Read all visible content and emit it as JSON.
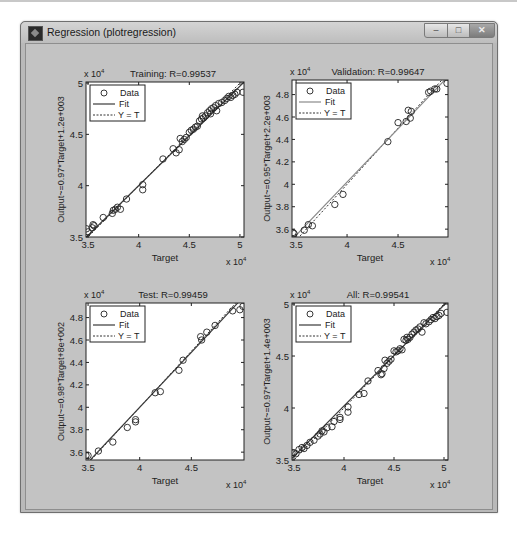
{
  "window": {
    "title": "Regression (plotregression)",
    "controls": {
      "minimize": "–",
      "maximize": "□",
      "close": "✕"
    }
  },
  "legend": {
    "data": "Data",
    "fit": "Fit",
    "yt": "Y = T"
  },
  "exponent_label": "x 10",
  "exponent_power": "4",
  "chart_data": [
    {
      "type": "scatter",
      "title": "Training: R=0.99537",
      "xlabel": "Target",
      "ylabel": "Output~=0.97*Target+1.2e+003",
      "xlim": [
        34800,
        50400
      ],
      "ylim": [
        35000,
        50100
      ],
      "xticks": [
        35000,
        40000,
        45000,
        50000
      ],
      "xtick_labels": [
        "3.5",
        "4",
        "4.5",
        "5"
      ],
      "yticks": [
        35000,
        40000,
        45000,
        50000
      ],
      "ytick_labels": [
        "3.5",
        "4",
        "4.5",
        "5"
      ],
      "fit": {
        "slope": 0.97,
        "intercept": 1200
      },
      "legend_position": "upper-left",
      "grid": false,
      "points": [
        [
          34850,
          35800
        ],
        [
          35000,
          35500
        ],
        [
          35400,
          35900
        ],
        [
          35500,
          36200
        ],
        [
          35600,
          36100
        ],
        [
          36500,
          36900
        ],
        [
          37400,
          37300
        ],
        [
          37500,
          37600
        ],
        [
          37700,
          37700
        ],
        [
          37900,
          37900
        ],
        [
          38200,
          37700
        ],
        [
          38800,
          38700
        ],
        [
          40400,
          40100
        ],
        [
          40400,
          39600
        ],
        [
          42400,
          42600
        ],
        [
          43400,
          43600
        ],
        [
          43700,
          43200
        ],
        [
          44000,
          43500
        ],
        [
          44100,
          44600
        ],
        [
          44300,
          44300
        ],
        [
          44500,
          44500
        ],
        [
          44700,
          44700
        ],
        [
          45000,
          45200
        ],
        [
          45200,
          45400
        ],
        [
          45400,
          45500
        ],
        [
          45600,
          45700
        ],
        [
          45800,
          45800
        ],
        [
          46000,
          46300
        ],
        [
          46200,
          46500
        ],
        [
          46300,
          46800
        ],
        [
          46400,
          46600
        ],
        [
          46600,
          46800
        ],
        [
          46800,
          47100
        ],
        [
          47000,
          47300
        ],
        [
          47100,
          47000
        ],
        [
          47200,
          47500
        ],
        [
          47400,
          47600
        ],
        [
          47600,
          47800
        ],
        [
          47700,
          47300
        ],
        [
          47900,
          48000
        ],
        [
          48200,
          48100
        ],
        [
          48500,
          48300
        ],
        [
          48700,
          48500
        ],
        [
          48900,
          48700
        ],
        [
          49100,
          48600
        ],
        [
          49300,
          48800
        ],
        [
          49500,
          48900
        ],
        [
          49700,
          49100
        ],
        [
          50300,
          49100
        ]
      ]
    },
    {
      "type": "scatter",
      "title": "Validation: R=0.99647",
      "xlabel": "Target",
      "ylabel": "Output~=0.95*Target+2.2e+003",
      "xlim": [
        34600,
        49900
      ],
      "ylim": [
        35300,
        49300
      ],
      "xticks": [
        35000,
        40000,
        45000
      ],
      "xtick_labels": [
        "3.5",
        "4",
        "4.5"
      ],
      "yticks": [
        36000,
        38000,
        40000,
        42000,
        44000,
        46000,
        48000
      ],
      "ytick_labels": [
        "3.6",
        "3.8",
        "4",
        "4.2",
        "4.4",
        "4.6",
        "4.8"
      ],
      "fit": {
        "slope": 0.95,
        "intercept": 2200
      },
      "legend_position": "upper-left",
      "grid": false,
      "points": [
        [
          34700,
          35700
        ],
        [
          34800,
          35600
        ],
        [
          35800,
          35900
        ],
        [
          36200,
          36400
        ],
        [
          36600,
          36300
        ],
        [
          38800,
          38200
        ],
        [
          39600,
          39100
        ],
        [
          44000,
          43800
        ],
        [
          45000,
          45500
        ],
        [
          45800,
          45600
        ],
        [
          46000,
          46600
        ],
        [
          46200,
          45900
        ],
        [
          46300,
          46500
        ],
        [
          48000,
          48200
        ],
        [
          48200,
          48300
        ],
        [
          48600,
          48500
        ],
        [
          48800,
          48500
        ],
        [
          49800,
          49000
        ]
      ]
    },
    {
      "type": "scatter",
      "title": "Test: R=0.99459",
      "xlabel": "Target",
      "ylabel": "Output~=0.98*Target+8e+002",
      "xlim": [
        34800,
        50100
      ],
      "ylim": [
        35300,
        49300
      ],
      "xticks": [
        35000,
        40000,
        45000
      ],
      "xtick_labels": [
        "3.5",
        "4",
        "4.5"
      ],
      "yticks": [
        36000,
        38000,
        40000,
        42000,
        44000,
        46000,
        48000
      ],
      "ytick_labels": [
        "3.6",
        "3.8",
        "4",
        "4.2",
        "4.4",
        "4.6",
        "4.8"
      ],
      "fit": {
        "slope": 0.98,
        "intercept": 800
      },
      "legend_position": "upper-left",
      "grid": false,
      "points": [
        [
          34800,
          35700
        ],
        [
          35000,
          35700
        ],
        [
          36000,
          36100
        ],
        [
          37400,
          36900
        ],
        [
          38800,
          38200
        ],
        [
          39600,
          38700
        ],
        [
          39600,
          38900
        ],
        [
          41500,
          41300
        ],
        [
          42000,
          41400
        ],
        [
          43800,
          43300
        ],
        [
          44200,
          44200
        ],
        [
          45900,
          46300
        ],
        [
          46000,
          46000
        ],
        [
          46500,
          46700
        ],
        [
          47300,
          47300
        ],
        [
          49000,
          48600
        ],
        [
          49700,
          48700
        ],
        [
          50000,
          49000
        ]
      ]
    },
    {
      "type": "scatter",
      "title": "All: R=0.99541",
      "xlabel": "Target",
      "ylabel": "Output~=0.97*Target+1.4e+003",
      "xlim": [
        34800,
        50400
      ],
      "ylim": [
        35000,
        50100
      ],
      "xticks": [
        35000,
        40000,
        45000,
        50000
      ],
      "xtick_labels": [
        "3.5",
        "4",
        "4.5",
        "5"
      ],
      "yticks": [
        35000,
        40000,
        45000,
        50000
      ],
      "ytick_labels": [
        "3.5",
        "4",
        "4.5",
        "5"
      ],
      "fit": {
        "slope": 0.97,
        "intercept": 1400
      },
      "legend_position": "upper-left",
      "grid": false,
      "points": [
        [
          34800,
          35700
        ],
        [
          35000,
          35700
        ],
        [
          35200,
          35600
        ],
        [
          35500,
          36000
        ],
        [
          35800,
          36200
        ],
        [
          36000,
          36100
        ],
        [
          36300,
          36400
        ],
        [
          36600,
          36700
        ],
        [
          37000,
          36900
        ],
        [
          37400,
          37300
        ],
        [
          37600,
          37500
        ],
        [
          37800,
          37800
        ],
        [
          38000,
          37700
        ],
        [
          38300,
          38100
        ],
        [
          38800,
          38200
        ],
        [
          39000,
          38700
        ],
        [
          39600,
          38900
        ],
        [
          39600,
          39100
        ],
        [
          40400,
          40100
        ],
        [
          40400,
          39600
        ],
        [
          41500,
          41300
        ],
        [
          42000,
          41400
        ],
        [
          42400,
          42600
        ],
        [
          43400,
          43600
        ],
        [
          43700,
          43200
        ],
        [
          43800,
          43300
        ],
        [
          44000,
          43800
        ],
        [
          44100,
          44600
        ],
        [
          44300,
          44300
        ],
        [
          44500,
          44500
        ],
        [
          44700,
          44700
        ],
        [
          45000,
          45500
        ],
        [
          45200,
          45400
        ],
        [
          45400,
          45500
        ],
        [
          45600,
          45700
        ],
        [
          45800,
          45600
        ],
        [
          46000,
          46600
        ],
        [
          46200,
          46500
        ],
        [
          46300,
          46800
        ],
        [
          46400,
          46600
        ],
        [
          46600,
          46800
        ],
        [
          46800,
          47100
        ],
        [
          47000,
          47300
        ],
        [
          47200,
          47500
        ],
        [
          47400,
          47600
        ],
        [
          47600,
          47800
        ],
        [
          47800,
          47300
        ],
        [
          48000,
          48200
        ],
        [
          48200,
          48100
        ],
        [
          48500,
          48300
        ],
        [
          48700,
          48500
        ],
        [
          48900,
          48700
        ],
        [
          49100,
          48600
        ],
        [
          49300,
          48800
        ],
        [
          49500,
          48900
        ],
        [
          49700,
          49100
        ],
        [
          50300,
          49200
        ]
      ]
    }
  ]
}
